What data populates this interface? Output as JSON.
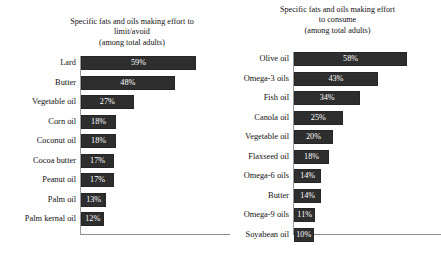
{
  "chart_data": [
    {
      "type": "bar",
      "orientation": "horizontal",
      "title": "Specific fats and oils making effort to limit/avoid (among total adults)",
      "title_lines": [
        "Specific fats and oils making effort to",
        "limit/avoid",
        "(among total adults)"
      ],
      "xlabel": "",
      "ylabel": "",
      "xlim": [
        0,
        100
      ],
      "grid": false,
      "legend": false,
      "value_suffix": "%",
      "categories": [
        "Lard",
        "Butter",
        "Vegetable oil",
        "Corn oil",
        "Coconut oil",
        "Cocoa butter",
        "Peanut oil",
        "Palm oil",
        "Palm kernal oil"
      ],
      "values": [
        59,
        48,
        27,
        18,
        18,
        17,
        17,
        13,
        12
      ],
      "value_labels": [
        "59%",
        "48%",
        "27%",
        "18%",
        "18%",
        "17%",
        "17%",
        "13%",
        "12%"
      ]
    },
    {
      "type": "bar",
      "orientation": "horizontal",
      "title": "Specific fats and oils making effort to consume (among total adults)",
      "title_lines": [
        "Specific fats and oils making effort",
        "to consume",
        "(among total adults)"
      ],
      "xlabel": "",
      "ylabel": "",
      "xlim": [
        0,
        100
      ],
      "grid": false,
      "legend": false,
      "value_suffix": "%",
      "categories": [
        "Olive oil",
        "Omega-3 oils",
        "Fish oil",
        "Canola oil",
        "Vegetable oil",
        "Flaxseed oil",
        "Omega-6 oils",
        "Butter",
        "Omega-9 oils",
        "Soyabean oil"
      ],
      "values": [
        58,
        43,
        34,
        25,
        20,
        18,
        14,
        14,
        11,
        10
      ],
      "value_labels": [
        "58%",
        "43%",
        "34%",
        "25%",
        "20%",
        "18%",
        "14%",
        "14%",
        "11%",
        "10%"
      ]
    }
  ],
  "style": {
    "bar_color": "#2e2e2e",
    "value_label_color": "#ffffff",
    "axis_color": "#8d8d8d",
    "text_color": "#111111",
    "background": "#ffffff"
  }
}
